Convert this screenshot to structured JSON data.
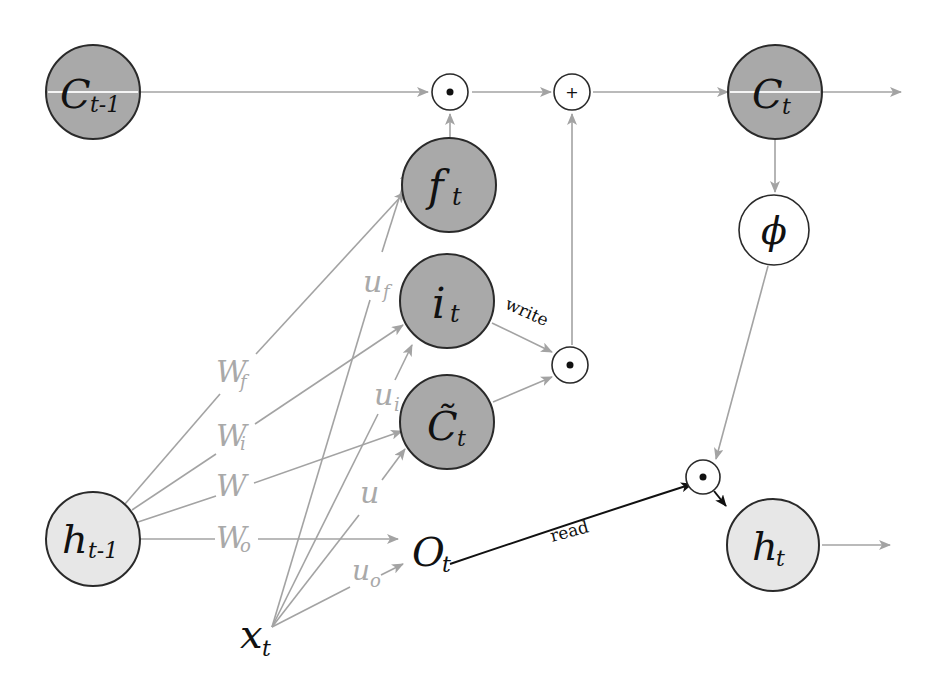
{
  "diagram": {
    "type": "LSTM cell",
    "colors": {
      "state_node": "#a9a9a9",
      "hidden_node": "#e7e7e7",
      "edge_gray": "#a3a3a3",
      "edge_dark": "#111111",
      "weight_label": "#a9a9a9"
    },
    "nodes": {
      "c_prev": {
        "main": "C",
        "sub": "t-1"
      },
      "c_t": {
        "main": "C",
        "sub": "t"
      },
      "f_t": {
        "main": "f",
        "sub": "t"
      },
      "i_t": {
        "main": "i",
        "sub": "t"
      },
      "c_tilde": {
        "main": "C̃",
        "sub": "t"
      },
      "o_t": {
        "main": "O",
        "sub": "t"
      },
      "h_prev": {
        "main": "h",
        "sub": "t-1"
      },
      "h_t": {
        "main": "h",
        "sub": "t"
      },
      "x_t": {
        "main": "x",
        "sub": "t"
      },
      "phi": {
        "main": "ϕ"
      }
    },
    "operators": {
      "forget_mult": "•",
      "cell_add": "+",
      "input_mult": "•",
      "output_mult": "•"
    },
    "weights": {
      "w_f": {
        "main": "W",
        "sub": "f"
      },
      "w_i": {
        "main": "W",
        "sub": "i"
      },
      "w": {
        "main": "W",
        "sub": ""
      },
      "w_o": {
        "main": "W",
        "sub": "o"
      },
      "u_f": {
        "main": "u",
        "sub": "f"
      },
      "u_i": {
        "main": "u",
        "sub": "i"
      },
      "u": {
        "main": "u",
        "sub": ""
      },
      "u_o": {
        "main": "u",
        "sub": "o"
      }
    },
    "edge_labels": {
      "write": "write",
      "read": "read"
    }
  }
}
